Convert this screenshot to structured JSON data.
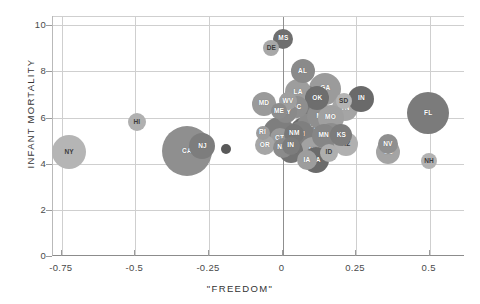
{
  "chart_data": {
    "type": "scatter",
    "title": "",
    "subtitle": "",
    "xlabel": "\"FREEDOM\"",
    "ylabel": "INFANT MORTALITY",
    "xlim": [
      -0.78,
      0.62
    ],
    "ylim": [
      0,
      10.4
    ],
    "xticks": [
      "-0.75",
      "-0.5",
      "-0.25",
      "0",
      "0.25",
      "0.5"
    ],
    "xtick_values": [
      -0.75,
      -0.5,
      -0.25,
      0,
      0.25,
      0.5
    ],
    "yticks": [
      "0",
      "2",
      "4",
      "6",
      "8",
      "10"
    ],
    "ytick_values": [
      0,
      2,
      4,
      6,
      8,
      10
    ],
    "grid": "both",
    "legend": "none",
    "bubble_size_meaning": "state population",
    "points": [
      {
        "label": "NY",
        "x": -0.725,
        "y": 4.5,
        "r": 17,
        "color": "#b5b5b5",
        "light": true
      },
      {
        "label": "HI",
        "x": -0.495,
        "y": 5.8,
        "r": 9,
        "color": "#b0b0b0",
        "light": true
      },
      {
        "label": "CA",
        "x": -0.325,
        "y": 4.55,
        "r": 25,
        "color": "#8f8f8f",
        "light": false
      },
      {
        "label": "NJ",
        "x": -0.272,
        "y": 4.75,
        "r": 13,
        "color": "#7d7d7d",
        "light": false
      },
      {
        "label": "",
        "x": -0.192,
        "y": 4.62,
        "r": 5,
        "color": "#595959",
        "light": false
      },
      {
        "label": "MD",
        "x": -0.063,
        "y": 6.6,
        "r": 12,
        "color": "#9a9a9a",
        "light": false
      },
      {
        "label": "DE",
        "x": -0.038,
        "y": 9.0,
        "r": 8,
        "color": "#a8a8a8",
        "light": true
      },
      {
        "label": "MS",
        "x": 0.003,
        "y": 9.42,
        "r": 10,
        "color": "#6f6f6f",
        "light": false
      },
      {
        "label": "AL",
        "x": 0.068,
        "y": 8.0,
        "r": 12,
        "color": "#8a8a8a",
        "light": false
      },
      {
        "label": "LA",
        "x": 0.053,
        "y": 7.1,
        "r": 13,
        "color": "#9d9d9d",
        "light": false
      },
      {
        "label": "WV",
        "x": 0.018,
        "y": 6.7,
        "r": 9,
        "color": "#9f9f9f",
        "light": false
      },
      {
        "label": "SC",
        "x": 0.048,
        "y": 6.45,
        "r": 11,
        "color": "#8e8e8e",
        "light": false
      },
      {
        "label": "NC",
        "x": 0.082,
        "y": 6.78,
        "r": 14,
        "color": "#7a7a7a",
        "light": false
      },
      {
        "label": "OK",
        "x": 0.118,
        "y": 6.85,
        "r": 12,
        "color": "#6e6e6e",
        "light": false
      },
      {
        "label": "GA",
        "x": 0.145,
        "y": 7.25,
        "r": 16,
        "color": "#9b9b9b",
        "light": false
      },
      {
        "label": "ME",
        "x": -0.012,
        "y": 6.28,
        "r": 8,
        "color": "#8d8d8d",
        "light": false
      },
      {
        "label": "KY",
        "x": 0.013,
        "y": 6.22,
        "r": 11,
        "color": "#8a8a8a",
        "light": false
      },
      {
        "label": "SD",
        "x": 0.208,
        "y": 6.72,
        "r": 8,
        "color": "#b4b4b4",
        "light": true
      },
      {
        "label": "TN",
        "x": 0.213,
        "y": 6.4,
        "r": 13,
        "color": "#a5a5a5",
        "light": false
      },
      {
        "label": "IN",
        "x": 0.268,
        "y": 6.82,
        "r": 13,
        "color": "#6a6a6a",
        "light": false
      },
      {
        "label": "FL",
        "x": 0.495,
        "y": 6.18,
        "r": 21,
        "color": "#7b7b7b",
        "light": false
      },
      {
        "label": "MI",
        "x": 0.128,
        "y": 6.05,
        "r": 13,
        "color": "#8f8f8f",
        "light": false
      },
      {
        "label": "MO",
        "x": 0.163,
        "y": 6.0,
        "r": 13,
        "color": "#a0a0a0",
        "light": false
      },
      {
        "label": "RI",
        "x": -0.068,
        "y": 5.35,
        "r": 7,
        "color": "#9c9c9c",
        "light": false
      },
      {
        "label": "IL",
        "x": -0.012,
        "y": 5.35,
        "r": 16,
        "color": "#7e7e7e",
        "light": false
      },
      {
        "label": "CT",
        "x": -0.01,
        "y": 5.1,
        "r": 10,
        "color": "#9a9a9a",
        "light": false
      },
      {
        "label": "PA",
        "x": 0.108,
        "y": 5.6,
        "r": 17,
        "color": "#8b8b8b",
        "light": false
      },
      {
        "label": "NM",
        "x": 0.04,
        "y": 5.3,
        "r": 10,
        "color": "#787878",
        "light": false
      },
      {
        "label": "WI",
        "x": 0.062,
        "y": 5.28,
        "r": 13,
        "color": "#7f7f7f",
        "light": false
      },
      {
        "label": "TX",
        "x": 0.085,
        "y": 5.22,
        "r": 20,
        "color": "#6d6d6d",
        "light": false
      },
      {
        "label": "MN",
        "x": 0.14,
        "y": 5.22,
        "r": 12,
        "color": "#868686",
        "light": false
      },
      {
        "label": "VA",
        "x": 0.163,
        "y": 5.22,
        "r": 13,
        "color": "#8d8d8d",
        "light": false
      },
      {
        "label": "KS",
        "x": 0.2,
        "y": 5.25,
        "r": 11,
        "color": "#7c7c7c",
        "light": false
      },
      {
        "label": "AZ",
        "x": 0.215,
        "y": 4.85,
        "r": 12,
        "color": "#b0b0b0",
        "light": true
      },
      {
        "label": "OR",
        "x": -0.06,
        "y": 4.8,
        "r": 10,
        "color": "#a6a6a6",
        "light": false
      },
      {
        "label": "NM",
        "x": 0.0,
        "y": 4.7,
        "r": 10,
        "color": "#8b8b8b",
        "light": false
      },
      {
        "label": "IN",
        "x": 0.028,
        "y": 4.78,
        "r": 9,
        "color": "#7c7c7c",
        "light": false
      },
      {
        "label": "WA",
        "x": 0.03,
        "y": 4.55,
        "r": 12,
        "color": "#737373",
        "light": false
      },
      {
        "label": "UT",
        "x": 0.105,
        "y": 4.58,
        "r": 13,
        "color": "#a2a2a2",
        "light": false
      },
      {
        "label": "ID",
        "x": 0.158,
        "y": 4.48,
        "r": 9,
        "color": "#aeaeae",
        "light": true
      },
      {
        "label": "IA",
        "x": 0.083,
        "y": 4.15,
        "r": 10,
        "color": "#9d9d9d",
        "light": false
      },
      {
        "label": "MA",
        "x": 0.112,
        "y": 4.15,
        "r": 13,
        "color": "#6b6b6b",
        "light": false
      },
      {
        "label": "NV",
        "x": 0.358,
        "y": 4.85,
        "r": 10,
        "color": "#8f8f8f",
        "light": false
      },
      {
        "label": "CO",
        "x": 0.36,
        "y": 4.5,
        "r": 12,
        "color": "#a4a4a4",
        "light": false
      },
      {
        "label": "NH",
        "x": 0.498,
        "y": 4.12,
        "r": 8,
        "color": "#b2b2b2",
        "light": true
      }
    ]
  },
  "axes": {
    "x_title": "\"FREEDOM\"",
    "y_title": "INFANT MORTALITY"
  }
}
